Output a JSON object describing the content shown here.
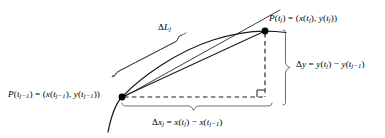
{
  "figure": {
    "background_color": "#ffffff",
    "ink_color": "#000000",
    "labels": {
      "upper_point": "P(tj) = (x(tj), y(tj))",
      "lower_point": "P(tj−1) = (x(tj−1), y(tj−1))",
      "delta_y": "Δy = y(tj) − y(tj−1)",
      "delta_x": "Δxj = x(tj) − x(tj−1)",
      "delta_l": "ΔLj"
    },
    "label_parts": {
      "upper_point": {
        "p": "P",
        "arg_open": "(",
        "t": "t",
        "sub_j": "j",
        "arg_close": ")",
        "equals": " = (",
        "x": "x",
        "comma": "), ",
        "y": "y",
        "end": "))"
      },
      "lower_point": {
        "sub_jm1": "j−1"
      },
      "delta_symbol": "Δ",
      "minus": "−"
    },
    "geometry": {
      "upper_point_xy": [
        265,
        31
      ],
      "lower_point_xy": [
        122,
        97
      ],
      "dot_radius": 3.4,
      "right_angle_marker_xy": [
        265,
        97
      ],
      "right_angle_size": 7,
      "dashed_vertical": {
        "x": 265,
        "y1": 31,
        "y2": 97
      },
      "dashed_horizontal": {
        "y": 97,
        "x1": 122,
        "x2": 265
      },
      "curve_label_brace_span": [
        110,
        200
      ],
      "delta_y_brace_span": [
        30,
        106
      ],
      "delta_x_brace_span": [
        122,
        272
      ]
    }
  }
}
